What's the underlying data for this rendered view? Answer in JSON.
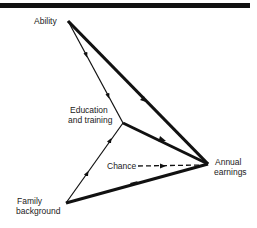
{
  "nodes": {
    "ability": "Ability",
    "education_line1": "Education",
    "education_line2": "and training",
    "chance": "Chance",
    "earnings_line1": "Annual",
    "earnings_line2": "earnings",
    "family_line1": "Family",
    "family_line2": "background"
  },
  "edges": [
    {
      "from": "Ability",
      "to": "Annual earnings",
      "weight": "thick"
    },
    {
      "from": "Ability",
      "to": "Education and training",
      "weight": "thin"
    },
    {
      "from": "Family background",
      "to": "Education and training",
      "weight": "thin"
    },
    {
      "from": "Education and training",
      "to": "Annual earnings",
      "weight": "thick"
    },
    {
      "from": "Family background",
      "to": "Annual earnings",
      "weight": "thick"
    },
    {
      "from": "Chance",
      "to": "Annual earnings",
      "weight": "dashed"
    }
  ]
}
